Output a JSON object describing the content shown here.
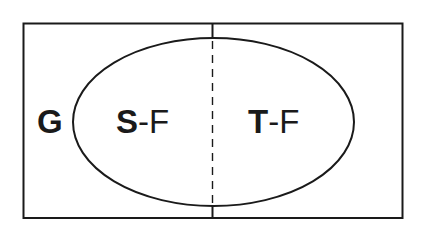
{
  "diagram": {
    "type": "venn-like set diagram",
    "outer_set": {
      "label": "G",
      "shape": "rectangle"
    },
    "inner_set": {
      "shape": "ellipse",
      "divider": "dashed vertical line"
    },
    "regions": [
      {
        "id": "left",
        "prefix": "S",
        "separator": "-",
        "suffix": "F"
      },
      {
        "id": "right",
        "prefix": "T",
        "separator": "-",
        "suffix": "F"
      }
    ],
    "colors": {
      "stroke": "#1a1a1a",
      "background": "#ffffff"
    }
  }
}
